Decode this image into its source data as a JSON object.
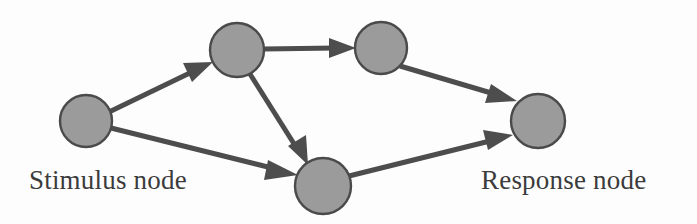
{
  "figure": {
    "background_color": "#fdfdfd",
    "width": 697,
    "height": 224
  },
  "style": {
    "node_fill": "#9b9b9b",
    "node_stroke": "#4a4a4a",
    "edge_color": "#4d4d4d",
    "text_color": "#3b3b3b"
  },
  "labels": {
    "stimulus": "Stimulus node",
    "response": "Response node"
  },
  "graph": {
    "type": "directed-network",
    "nodes": [
      {
        "id": "stimulus",
        "label": "Stimulus node",
        "cx": 86,
        "cy": 121,
        "r": 26
      },
      {
        "id": "hidden-top-left",
        "label": "",
        "cx": 237,
        "cy": 50,
        "r": 27
      },
      {
        "id": "hidden-top-right",
        "label": "",
        "cx": 381,
        "cy": 48,
        "r": 26
      },
      {
        "id": "hidden-bottom",
        "label": "",
        "cx": 323,
        "cy": 186,
        "r": 28
      },
      {
        "id": "response",
        "label": "Response node",
        "cx": 538,
        "cy": 121,
        "r": 27
      }
    ],
    "edges": [
      {
        "from": "stimulus",
        "to": "hidden-top-left"
      },
      {
        "from": "stimulus",
        "to": "hidden-bottom"
      },
      {
        "from": "hidden-top-left",
        "to": "hidden-top-right"
      },
      {
        "from": "hidden-top-left",
        "to": "hidden-bottom"
      },
      {
        "from": "hidden-top-right",
        "to": "response"
      },
      {
        "from": "hidden-bottom",
        "to": "response"
      }
    ]
  }
}
